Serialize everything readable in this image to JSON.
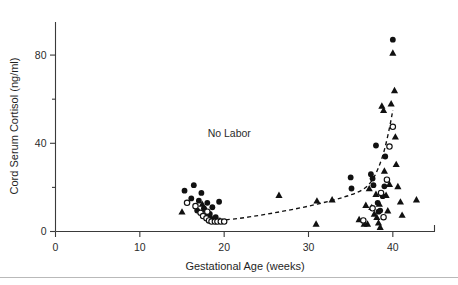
{
  "chart_data": {
    "type": "scatter",
    "title": "",
    "xlabel": "Gestational Age (weeks)",
    "ylabel": "Cord Serum Cortisol (ng/ml)",
    "xlim": [
      0,
      45
    ],
    "ylim": [
      0,
      95
    ],
    "xticks_major": [
      0,
      10,
      20,
      30,
      40
    ],
    "xtick_labels": [
      "0",
      "10",
      "20",
      "30",
      "40"
    ],
    "yticks_major": [
      0,
      40,
      80
    ],
    "ytick_labels": [
      "0",
      "40",
      "80"
    ],
    "yticks_minor": [
      20,
      60
    ],
    "grid": false,
    "legend": null,
    "annotations": [
      {
        "text": "No Labor",
        "x": 20.6,
        "y": 43
      }
    ],
    "series": [
      {
        "name": "filled-circle",
        "marker": "filled circle",
        "points": [
          [
            15.3,
            18.5
          ],
          [
            16.1,
            15.0
          ],
          [
            16.4,
            21.0
          ],
          [
            17.0,
            14.0
          ],
          [
            17.3,
            17.5
          ],
          [
            17.6,
            10.5
          ],
          [
            18.0,
            13.0
          ],
          [
            18.3,
            8.0
          ],
          [
            18.6,
            11.0
          ],
          [
            19.0,
            6.5
          ],
          [
            19.4,
            13.5
          ],
          [
            16.8,
            9.5
          ],
          [
            35.0,
            24.5
          ],
          [
            35.1,
            19.5
          ],
          [
            37.6,
            24.0
          ],
          [
            37.7,
            21.0
          ],
          [
            38.0,
            39.0
          ],
          [
            38.2,
            13.0
          ],
          [
            38.3,
            9.0
          ],
          [
            38.5,
            9.5
          ],
          [
            39.0,
            20.5
          ],
          [
            39.1,
            34.0
          ],
          [
            40.0,
            87.0
          ],
          [
            38.8,
            16.0
          ],
          [
            37.4,
            26.0
          ]
        ]
      },
      {
        "name": "open-circle",
        "marker": "open circle",
        "points": [
          [
            15.6,
            13.0
          ],
          [
            16.6,
            11.5
          ],
          [
            17.2,
            8.5
          ],
          [
            17.5,
            7.0
          ],
          [
            17.9,
            6.0
          ],
          [
            18.2,
            5.0
          ],
          [
            18.5,
            4.5
          ],
          [
            18.9,
            4.5
          ],
          [
            19.2,
            4.5
          ],
          [
            19.6,
            4.5
          ],
          [
            20.0,
            4.5
          ],
          [
            18.0,
            9.0
          ],
          [
            36.5,
            5.0
          ],
          [
            37.6,
            10.5
          ],
          [
            38.6,
            17.5
          ],
          [
            39.3,
            23.5
          ],
          [
            39.6,
            38.5
          ],
          [
            40.0,
            47.5
          ],
          [
            38.9,
            6.5
          ]
        ]
      },
      {
        "name": "triangle",
        "marker": "filled triangle",
        "points": [
          [
            15.0,
            9.0
          ],
          [
            17.4,
            12.5
          ],
          [
            17.8,
            10.0
          ],
          [
            18.1,
            8.5
          ],
          [
            18.4,
            7.0
          ],
          [
            18.8,
            6.0
          ],
          [
            19.1,
            5.5
          ],
          [
            19.5,
            5.0
          ],
          [
            26.5,
            16.5
          ],
          [
            30.9,
            3.5
          ],
          [
            31.0,
            14.0
          ],
          [
            32.8,
            14.5
          ],
          [
            36.6,
            3.5
          ],
          [
            37.0,
            3.5
          ],
          [
            37.2,
            19.5
          ],
          [
            37.5,
            11.0
          ],
          [
            37.8,
            8.0
          ],
          [
            38.0,
            17.0
          ],
          [
            38.1,
            6.5
          ],
          [
            38.4,
            12.5
          ],
          [
            38.5,
            2.0
          ],
          [
            38.7,
            57.0
          ],
          [
            38.9,
            55.0
          ],
          [
            39.0,
            27.5
          ],
          [
            39.2,
            16.5
          ],
          [
            39.4,
            9.5
          ],
          [
            39.6,
            21.5
          ],
          [
            39.8,
            58.0
          ],
          [
            40.0,
            81.0
          ],
          [
            40.2,
            64.0
          ],
          [
            40.3,
            43.0
          ],
          [
            40.4,
            30.5
          ],
          [
            40.6,
            20.5
          ],
          [
            40.9,
            13.5
          ],
          [
            41.1,
            7.5
          ],
          [
            42.8,
            14.5
          ],
          [
            36.0,
            5.5
          ],
          [
            36.8,
            12.0
          ],
          [
            38.3,
            4.0
          ]
        ]
      }
    ],
    "fit_curve": {
      "name": "no-labor-trend",
      "style": "dashed",
      "points": [
        [
          17.7,
          5.8
        ],
        [
          19.0,
          5.2
        ],
        [
          21.0,
          5.6
        ],
        [
          24.0,
          7.2
        ],
        [
          27.0,
          9.2
        ],
        [
          30.0,
          11.5
        ],
        [
          33.0,
          14.3
        ],
        [
          35.0,
          16.6
        ],
        [
          36.5,
          19.2
        ],
        [
          37.5,
          23.0
        ],
        [
          38.3,
          29.0
        ],
        [
          39.0,
          37.0
        ],
        [
          39.6,
          47.0
        ],
        [
          40.0,
          55.0
        ]
      ]
    }
  }
}
